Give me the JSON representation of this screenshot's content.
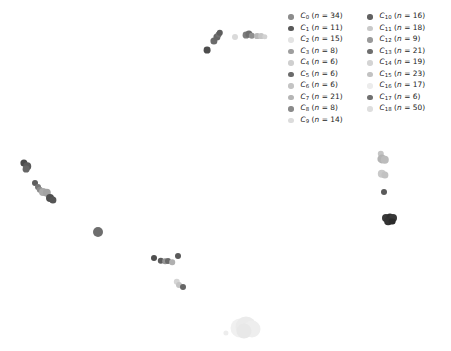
{
  "figure": {
    "width": 451,
    "height": 351,
    "background": "#ffffff"
  },
  "legend": {
    "position": "top-right",
    "columns": 2,
    "entries": [
      {
        "cluster": "C",
        "index": "0",
        "n": 34,
        "label": "C0 (n = 34)",
        "color": "#8c8c8c",
        "column": 0
      },
      {
        "cluster": "C",
        "index": "1",
        "n": 11,
        "label": "C1 (n = 11)",
        "color": "#595959",
        "column": 0
      },
      {
        "cluster": "C",
        "index": "2",
        "n": 15,
        "label": "C2 (n = 15)",
        "color": "#e3e3e3",
        "column": 0
      },
      {
        "cluster": "C",
        "index": "3",
        "n": 8,
        "label": "C3 (n = 8)",
        "color": "#9e9e9e",
        "column": 0
      },
      {
        "cluster": "C",
        "index": "4",
        "n": 6,
        "label": "C4 (n = 6)",
        "color": "#cfcfcf",
        "column": 0
      },
      {
        "cluster": "C",
        "index": "5",
        "n": 6,
        "label": "C5 (n = 6)",
        "color": "#6b6b6b",
        "column": 0
      },
      {
        "cluster": "C",
        "index": "6",
        "n": 6,
        "label": "C6 (n = 6)",
        "color": "#c4c4c4",
        "column": 0
      },
      {
        "cluster": "C",
        "index": "7",
        "n": 21,
        "label": "C7 (n = 21)",
        "color": "#b5b5b5",
        "column": 0
      },
      {
        "cluster": "C",
        "index": "8",
        "n": 8,
        "label": "C8 (n = 8)",
        "color": "#8a8a8a",
        "column": 0
      },
      {
        "cluster": "C",
        "index": "9",
        "n": 14,
        "label": "C9 (n = 14)",
        "color": "#dcdcdc",
        "column": 0
      },
      {
        "cluster": "C",
        "index": "10",
        "n": 16,
        "label": "C10 (n = 16)",
        "color": "#616161",
        "column": 1
      },
      {
        "cluster": "C",
        "index": "11",
        "n": 18,
        "label": "C11 (n = 18)",
        "color": "#c9c9c9",
        "column": 1
      },
      {
        "cluster": "C",
        "index": "12",
        "n": 9,
        "label": "C12 (n = 9)",
        "color": "#9a9a9a",
        "column": 1
      },
      {
        "cluster": "C",
        "index": "13",
        "n": 21,
        "label": "C13 (n = 21)",
        "color": "#6e6e6e",
        "column": 1
      },
      {
        "cluster": "C",
        "index": "14",
        "n": 19,
        "label": "C14 (n = 19)",
        "color": "#d4d4d4",
        "column": 1
      },
      {
        "cluster": "C",
        "index": "15",
        "n": 23,
        "label": "C15 (n = 23)",
        "color": "#c2c2c2",
        "column": 1
      },
      {
        "cluster": "C",
        "index": "16",
        "n": 17,
        "label": "C16 (n = 17)",
        "color": "#ececec",
        "column": 1
      },
      {
        "cluster": "C",
        "index": "17",
        "n": 6,
        "label": "C17 (n = 6)",
        "color": "#707070",
        "column": 1
      },
      {
        "cluster": "C",
        "index": "18",
        "n": 50,
        "label": "C18 (n = 50)",
        "color": "#dedede",
        "column": 1
      }
    ]
  },
  "chart_data": {
    "type": "scatter",
    "title": "",
    "xlabel": "",
    "ylabel": "",
    "xlim": [
      0,
      451
    ],
    "ylim": [
      0,
      351
    ],
    "grid": false,
    "axes_visible": false,
    "legend_position": "upper right",
    "note": "Cluster scatter (UMAP/t-SNE style) embedding; point coordinates are in pixel space of the 451x351 figure, y measured downward from the top.",
    "points": [
      {
        "x": 207,
        "y": 50,
        "r": 3.4,
        "color": "#4d4d4d"
      },
      {
        "x": 214,
        "y": 41,
        "r": 3.6,
        "color": "#6b6b6b"
      },
      {
        "x": 216.5,
        "y": 37,
        "r": 3.6,
        "color": "#666666"
      },
      {
        "x": 218.5,
        "y": 34.5,
        "r": 3.4,
        "color": "#707070"
      },
      {
        "x": 220,
        "y": 32.5,
        "r": 3.2,
        "color": "#5e5e5e"
      },
      {
        "x": 235,
        "y": 37,
        "r": 3.0,
        "color": "#dadada"
      },
      {
        "x": 246,
        "y": 35,
        "r": 3.4,
        "color": "#7d7d7d"
      },
      {
        "x": 249,
        "y": 34,
        "r": 3.6,
        "color": "#6f6f6f"
      },
      {
        "x": 252,
        "y": 35.5,
        "r": 3.2,
        "color": "#8f8f8f"
      },
      {
        "x": 257,
        "y": 36,
        "r": 2.9,
        "color": "#b8b8b8"
      },
      {
        "x": 261,
        "y": 36,
        "r": 2.9,
        "color": "#c6c6c6"
      },
      {
        "x": 264.5,
        "y": 36.5,
        "r": 2.7,
        "color": "#d2d2d2"
      },
      {
        "x": 24,
        "y": 163,
        "r": 3.6,
        "color": "#4a4a4a"
      },
      {
        "x": 27,
        "y": 166,
        "r": 3.8,
        "color": "#5a5a5a"
      },
      {
        "x": 26,
        "y": 169,
        "r": 3.4,
        "color": "#666666"
      },
      {
        "x": 35,
        "y": 183,
        "r": 3.0,
        "color": "#5e5e5e"
      },
      {
        "x": 37.5,
        "y": 187,
        "r": 3.0,
        "color": "#777777"
      },
      {
        "x": 40,
        "y": 190,
        "r": 3.2,
        "color": "#8c8c8c"
      },
      {
        "x": 43,
        "y": 192,
        "r": 4.0,
        "color": "#aaaaaa"
      },
      {
        "x": 46.5,
        "y": 193,
        "r": 4.2,
        "color": "#a3a3a3"
      },
      {
        "x": 50,
        "y": 198,
        "r": 4.0,
        "color": "#4f4f4f"
      },
      {
        "x": 53,
        "y": 200,
        "r": 3.6,
        "color": "#555555"
      },
      {
        "x": 98,
        "y": 232,
        "r": 5.0,
        "color": "#6e6e6e"
      },
      {
        "x": 154,
        "y": 258,
        "r": 3.0,
        "color": "#4f4f4f"
      },
      {
        "x": 161,
        "y": 261,
        "r": 3.2,
        "color": "#5c5c5c"
      },
      {
        "x": 165,
        "y": 261,
        "r": 2.8,
        "color": "#949494"
      },
      {
        "x": 168,
        "y": 261,
        "r": 3.0,
        "color": "#6a6a6a"
      },
      {
        "x": 172,
        "y": 262,
        "r": 2.8,
        "color": "#b0b0b0"
      },
      {
        "x": 178,
        "y": 256,
        "r": 3.0,
        "color": "#5a5a5a"
      },
      {
        "x": 177,
        "y": 282,
        "r": 3.2,
        "color": "#d5d5d5"
      },
      {
        "x": 179,
        "y": 285,
        "r": 3.0,
        "color": "#c4c4c4"
      },
      {
        "x": 183,
        "y": 287,
        "r": 3.0,
        "color": "#666666"
      },
      {
        "x": 381,
        "y": 154,
        "r": 3.2,
        "color": "#c5c5c5"
      },
      {
        "x": 382,
        "y": 159,
        "r": 4.6,
        "color": "#b4b4b4"
      },
      {
        "x": 385,
        "y": 160,
        "r": 4.2,
        "color": "#bcbcbc"
      },
      {
        "x": 382,
        "y": 174,
        "r": 4.2,
        "color": "#c9c9c9"
      },
      {
        "x": 385,
        "y": 175,
        "r": 3.6,
        "color": "#c2c2c2"
      },
      {
        "x": 384,
        "y": 192,
        "r": 3.0,
        "color": "#5a5a5a"
      },
      {
        "x": 386,
        "y": 218,
        "r": 4.0,
        "color": "#3a3a3a"
      },
      {
        "x": 390,
        "y": 217,
        "r": 3.6,
        "color": "#2f2f2f"
      },
      {
        "x": 393,
        "y": 218,
        "r": 4.0,
        "color": "#383838"
      },
      {
        "x": 388,
        "y": 221,
        "r": 3.8,
        "color": "#333333"
      },
      {
        "x": 392,
        "y": 221.5,
        "r": 3.4,
        "color": "#2b2b2b"
      },
      {
        "x": 226,
        "y": 333,
        "r": 2.6,
        "color": "#ededed"
      },
      {
        "x": 240,
        "y": 328,
        "r": 9.5,
        "color": "#f0f0f0"
      },
      {
        "x": 246,
        "y": 327,
        "r": 10.5,
        "color": "#ebebeb"
      },
      {
        "x": 252,
        "y": 329,
        "r": 8.5,
        "color": "#eeeeee"
      },
      {
        "x": 244,
        "y": 331,
        "r": 7.5,
        "color": "#e8e8e8"
      }
    ]
  }
}
